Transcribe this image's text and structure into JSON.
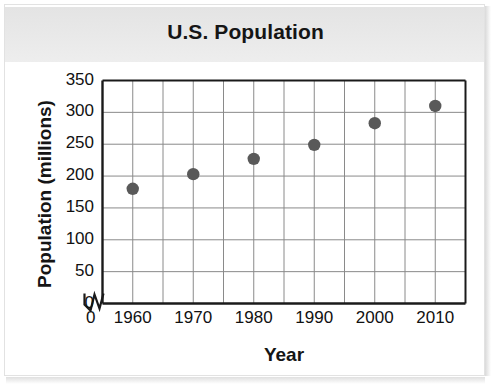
{
  "chart_data": {
    "type": "scatter",
    "title": "U.S. Population",
    "xlabel": "Year",
    "ylabel": "Population (millions)",
    "x": [
      1960,
      1970,
      1980,
      1990,
      2000,
      2010
    ],
    "values": [
      180,
      203,
      227,
      249,
      283,
      310
    ],
    "series": [
      {
        "name": "U.S. Population",
        "values": [
          180,
          203,
          227,
          249,
          283,
          310
        ]
      }
    ],
    "xlim": [
      1955,
      2015
    ],
    "ylim": [
      0,
      350
    ],
    "xticks": [
      1960,
      1970,
      1980,
      1990,
      2000,
      2010
    ],
    "xtick_labels": [
      "1960",
      "1970",
      "1980",
      "1990",
      "2000",
      "2010"
    ],
    "yticks": [
      0,
      50,
      100,
      150,
      200,
      250,
      300,
      350
    ],
    "ytick_labels": [
      "0",
      "50",
      "100",
      "150",
      "200",
      "250",
      "300",
      "350"
    ],
    "x_origin_label": "0",
    "axis_break": true,
    "grid": true,
    "minor_x_gridlines": true,
    "legend": "none",
    "marker": "circle",
    "marker_color": "#595959",
    "grid_color": "#8a8a8a",
    "axis_color": "#1a1a1a",
    "plot_background": "#ffffff"
  },
  "figure": {
    "background": "#ffffff",
    "title_band_color": "#ededed",
    "border_color": "#e2e2e2"
  }
}
